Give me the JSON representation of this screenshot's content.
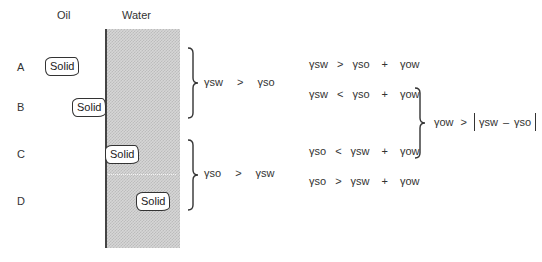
{
  "labels": {
    "oil": "Oil",
    "water": "Water",
    "cases": [
      "A",
      "B",
      "C",
      "D"
    ]
  },
  "solid_label": "Solid",
  "regimes": [
    {
      "lhs": "γsw",
      "op": ">",
      "rhs": "γso"
    },
    {
      "lhs": "γso",
      "op": ">",
      "rhs": "γsw"
    }
  ],
  "conditions": [
    {
      "a": "γsw",
      "op": ">",
      "b": "γso",
      "plus": "+",
      "c": "γow"
    },
    {
      "a": "γsw",
      "op": "<",
      "b": "γso",
      "plus": "+",
      "c": "γow"
    },
    {
      "a": "γso",
      "op": "<",
      "b": "γsw",
      "plus": "+",
      "c": "γow"
    },
    {
      "a": "γso",
      "op": ">",
      "b": "γsw",
      "plus": "+",
      "c": "γow"
    }
  ],
  "combined": {
    "lhs": "γow",
    "op": ">",
    "abs_left": "γsw",
    "minus": "–",
    "abs_right": "γso"
  }
}
